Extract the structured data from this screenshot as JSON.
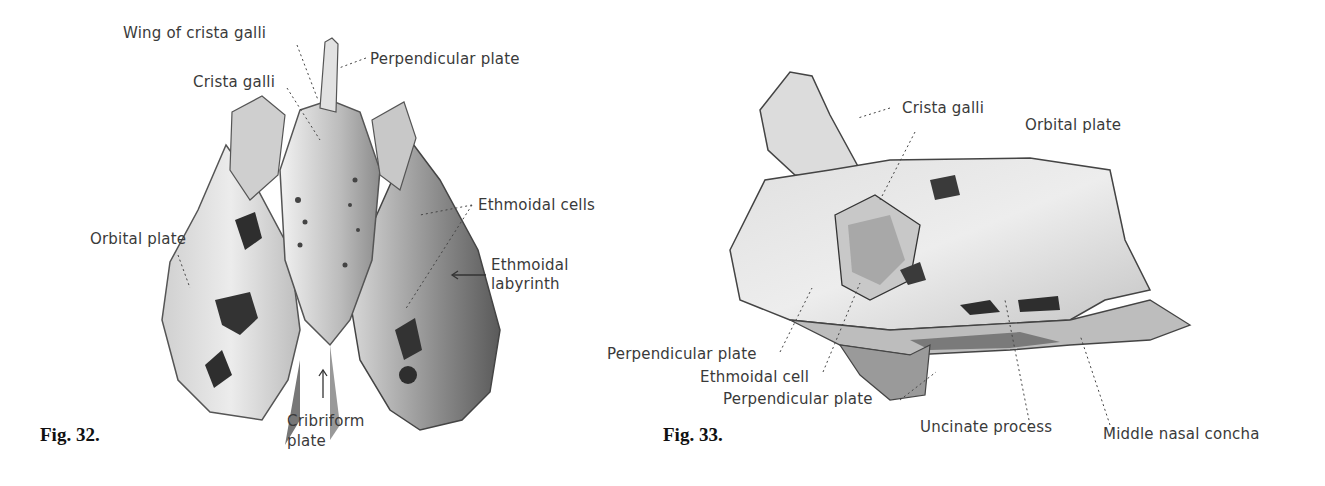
{
  "figures": [
    {
      "id": "fig32",
      "caption": "Fig. 32.",
      "labels": {
        "wing_of_crista_galli": "Wing of crista galli",
        "perpendicular_plate": "Perpendicular plate",
        "crista_galli": "Crista galli",
        "ethmoidal_cells": "Ethmoidal cells",
        "orbital_plate": "Orbital plate",
        "ethmoidal_labyrinth_1": "Ethmoidal",
        "ethmoidal_labyrinth_2": "labyrinth",
        "cribriform_plate_1": "Cribriform",
        "cribriform_plate_2": "plate"
      }
    },
    {
      "id": "fig33",
      "caption": "Fig. 33.",
      "labels": {
        "crista_galli": "Crista galli",
        "orbital_plate": "Orbital plate",
        "perpendicular_plate_upper": "Perpendicular plate",
        "ethmoidal_cell": "Ethmoidal cell",
        "perpendicular_plate_lower": "Perpendicular plate",
        "uncinate_process": "Uncinate process",
        "middle_nasal_concha": "Middle nasal concha"
      }
    }
  ],
  "colors": {
    "ink": "#3a3a3a",
    "bone_light": "#e6e6e6",
    "bone_mid": "#bdbdbd",
    "bone_dark": "#6e6e6e",
    "cavity": "#2e2e2e"
  }
}
